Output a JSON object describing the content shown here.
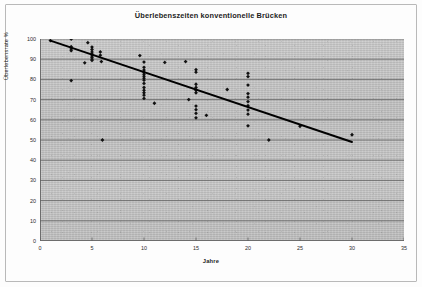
{
  "chart_data": {
    "type": "scatter",
    "title": "Überlebenszeiten konventionelle Brücken",
    "xlabel": "Jahre",
    "ylabel": "Überlebensrate %",
    "xlim": [
      0,
      35
    ],
    "ylim": [
      0,
      100
    ],
    "xticks": [
      0,
      5,
      10,
      15,
      20,
      25,
      30,
      35
    ],
    "yticks": [
      0,
      10,
      20,
      30,
      40,
      50,
      60,
      70,
      80,
      90,
      100
    ],
    "grid": "horizontal",
    "legend": "none",
    "marker": "diamond",
    "marker_color": "#111111",
    "series": [
      {
        "name": "Überlebensrate",
        "points": [
          [
            1,
            99.2
          ],
          [
            3,
            100.0
          ],
          [
            3,
            96.2
          ],
          [
            3,
            95.0
          ],
          [
            3,
            94.2
          ],
          [
            3,
            79.4
          ],
          [
            4.3,
            88.2
          ],
          [
            4.6,
            98.2
          ],
          [
            5,
            96.0
          ],
          [
            5,
            94.8
          ],
          [
            5,
            93.6
          ],
          [
            5,
            92.6
          ],
          [
            5,
            91.6
          ],
          [
            5,
            90.8
          ],
          [
            5,
            90.0
          ],
          [
            5,
            89.4
          ],
          [
            5.8,
            93.6
          ],
          [
            5.8,
            92.0
          ],
          [
            5.9,
            88.8
          ],
          [
            6,
            50.0
          ],
          [
            9.6,
            91.8
          ],
          [
            10,
            88.6
          ],
          [
            10,
            86.0
          ],
          [
            10,
            84.6
          ],
          [
            10,
            83.6
          ],
          [
            10,
            82.6
          ],
          [
            10,
            81.6
          ],
          [
            10,
            80.6
          ],
          [
            10,
            79.6
          ],
          [
            10,
            78.0
          ],
          [
            10,
            76.0
          ],
          [
            10,
            74.6
          ],
          [
            10,
            73.4
          ],
          [
            10,
            72.2
          ],
          [
            10,
            70.6
          ],
          [
            11,
            68.2
          ],
          [
            12,
            88.4
          ],
          [
            14,
            88.8
          ],
          [
            14.3,
            70.0
          ],
          [
            15,
            84.8
          ],
          [
            15,
            83.6
          ],
          [
            15,
            77.6
          ],
          [
            15,
            76.0
          ],
          [
            15,
            74.6
          ],
          [
            15,
            73.4
          ],
          [
            15,
            66.8
          ],
          [
            15,
            65.0
          ],
          [
            15,
            63.2
          ],
          [
            15,
            61.0
          ],
          [
            16,
            62.2
          ],
          [
            18,
            75.0
          ],
          [
            20,
            83.0
          ],
          [
            20,
            81.4
          ],
          [
            20,
            77.2
          ],
          [
            20,
            73.0
          ],
          [
            20,
            71.2
          ],
          [
            20,
            69.0
          ],
          [
            20,
            67.0
          ],
          [
            20,
            64.8
          ],
          [
            20,
            62.8
          ],
          [
            20,
            57.0
          ],
          [
            22,
            50.0
          ],
          [
            25,
            56.8
          ],
          [
            30,
            52.6
          ]
        ]
      }
    ],
    "trendline": {
      "name": "Regressionsgerade",
      "x_start": 1,
      "y_start": 99.2,
      "x_end": 30,
      "y_end": 49.0,
      "color": "#000000"
    }
  }
}
